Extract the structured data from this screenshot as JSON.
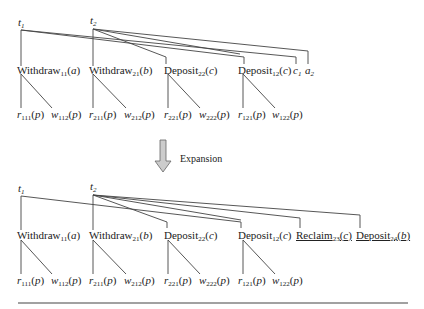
{
  "arrow_label": "Expansion",
  "top_tree": {
    "roots": [
      "t1",
      "t2"
    ],
    "operations": [
      {
        "name": "Withdraw",
        "sub": "11",
        "arg": "a"
      },
      {
        "name": "Withdraw",
        "sub": "21",
        "arg": "b"
      },
      {
        "name": "Deposit",
        "sub": "22",
        "arg": "c"
      },
      {
        "name": "Deposit",
        "sub": "12",
        "arg": "c"
      }
    ],
    "terminals": [
      {
        "sym": "c",
        "sub": "1"
      },
      {
        "sym": "a",
        "sub": "2"
      }
    ],
    "leaves": [
      {
        "sym": "r",
        "sub": "111",
        "arg": "p"
      },
      {
        "sym": "w",
        "sub": "112",
        "arg": "p"
      },
      {
        "sym": "r",
        "sub": "211",
        "arg": "p"
      },
      {
        "sym": "w",
        "sub": "212",
        "arg": "p"
      },
      {
        "sym": "r",
        "sub": "221",
        "arg": "p"
      },
      {
        "sym": "w",
        "sub": "222",
        "arg": "p"
      },
      {
        "sym": "r",
        "sub": "121",
        "arg": "p"
      },
      {
        "sym": "w",
        "sub": "122",
        "arg": "p"
      }
    ]
  },
  "bottom_tree": {
    "roots": [
      "t1",
      "t2"
    ],
    "operations": [
      {
        "name": "Withdraw",
        "sub": "11",
        "arg": "a"
      },
      {
        "name": "Withdraw",
        "sub": "21",
        "arg": "b"
      },
      {
        "name": "Deposit",
        "sub": "22",
        "arg": "c"
      },
      {
        "name": "Deposit",
        "sub": "12",
        "arg": "c"
      },
      {
        "name": "Reclaim",
        "sub": "23",
        "arg": "c",
        "underlined": true
      },
      {
        "name": "Deposit",
        "sub": "24",
        "arg": "b",
        "underlined": true
      }
    ],
    "leaves": [
      {
        "sym": "r",
        "sub": "111",
        "arg": "p"
      },
      {
        "sym": "w",
        "sub": "112",
        "arg": "p"
      },
      {
        "sym": "r",
        "sub": "211",
        "arg": "p"
      },
      {
        "sym": "w",
        "sub": "212",
        "arg": "p"
      },
      {
        "sym": "r",
        "sub": "221",
        "arg": "p"
      },
      {
        "sym": "w",
        "sub": "222",
        "arg": "p"
      },
      {
        "sym": "r",
        "sub": "121",
        "arg": "p"
      },
      {
        "sym": "w",
        "sub": "122",
        "arg": "p"
      }
    ]
  }
}
